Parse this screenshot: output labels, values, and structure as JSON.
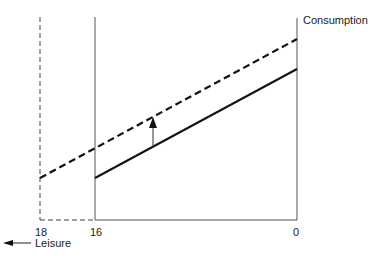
{
  "diagram": {
    "y_axis_label": "Consumption",
    "x_axis_label": "Leisure",
    "ticks": {
      "left_dashed": "18",
      "left_solid": "16",
      "origin": "0"
    },
    "lines": [
      {
        "name": "original budget constraint",
        "style": "solid",
        "from_leisure": 16
      },
      {
        "name": "shifted budget constraint",
        "style": "dashed",
        "from_leisure": 18
      }
    ],
    "shift_arrow": "upward shift"
  }
}
